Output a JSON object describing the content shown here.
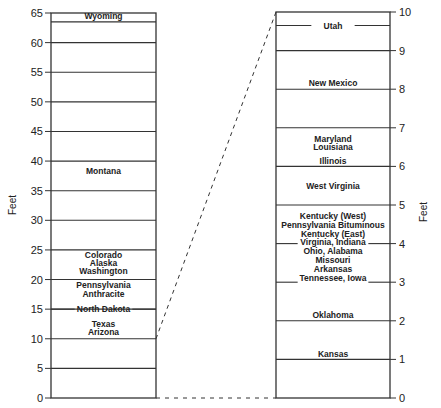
{
  "chart_data": [
    {
      "type": "bar",
      "title": "",
      "ylabel": "Feet",
      "ylim": [
        0,
        65
      ],
      "yticks": [
        0,
        5,
        10,
        15,
        20,
        25,
        30,
        35,
        40,
        45,
        50,
        55,
        60,
        65
      ],
      "grid": true,
      "lines": [
        5,
        10,
        15,
        20,
        25,
        30,
        35,
        40,
        45,
        50,
        55,
        60,
        63.5
      ],
      "gapped_lines": [
        15
      ],
      "labels": [
        {
          "text": "Wyoming",
          "y": 64.5
        },
        {
          "text": "Montana",
          "y": 38.3
        },
        {
          "text": "Colorado",
          "y": 24.2
        },
        {
          "text": "Alaska",
          "y": 22.8
        },
        {
          "text": "Washington",
          "y": 21.4
        },
        {
          "text": "Pennsylvania",
          "y": 19.0
        },
        {
          "text": "Anthracite",
          "y": 17.5
        },
        {
          "text": "North Dakota",
          "y": 15.0
        },
        {
          "text": "Texas",
          "y": 12.5
        },
        {
          "text": "Arizona",
          "y": 11.1
        }
      ]
    },
    {
      "type": "bar",
      "title": "",
      "ylabel": "Feet",
      "ylim": [
        0,
        10
      ],
      "yticks": [
        0,
        1,
        2,
        3,
        4,
        5,
        6,
        7,
        8,
        9,
        10
      ],
      "grid": true,
      "lines": [
        1,
        2,
        5,
        6,
        7,
        8,
        9
      ],
      "gapped_lines": [
        9.65,
        4,
        3
      ],
      "labels": [
        {
          "text": "Utah",
          "y": 9.65
        },
        {
          "text": "New Mexico",
          "y": 8.15
        },
        {
          "text": "Maryland",
          "y": 6.72
        },
        {
          "text": "Louisiana",
          "y": 6.49
        },
        {
          "text": "Illinois",
          "y": 6.15
        },
        {
          "text": "West Virginia",
          "y": 5.5
        },
        {
          "text": "Kentucky (West)",
          "y": 4.72
        },
        {
          "text": "Pennsylvania Bituminous",
          "y": 4.49
        },
        {
          "text": "Kentucky (East)",
          "y": 4.26
        },
        {
          "text": "Virginia, Indiana",
          "y": 4.03
        },
        {
          "text": "Ohio, Alabama",
          "y": 3.8
        },
        {
          "text": "Missouri",
          "y": 3.57
        },
        {
          "text": "Arkansas",
          "y": 3.34
        },
        {
          "text": "Tennessee, Iowa",
          "y": 3.1
        },
        {
          "text": "Oklahoma",
          "y": 2.16
        },
        {
          "text": "Kansas",
          "y": 1.15
        }
      ]
    }
  ],
  "connector": {
    "from_left_range": [
      0,
      10
    ],
    "to_right_range": [
      0,
      10
    ],
    "style": "dashed"
  }
}
